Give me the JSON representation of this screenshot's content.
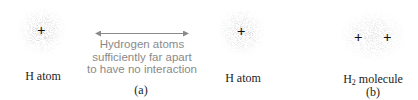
{
  "panel_a": {
    "left_atom_label": "H atom",
    "right_atom_label": "H atom",
    "description_lines": [
      "Hydrogen atoms",
      "sufficiently far apart",
      "to have no interaction"
    ],
    "caption": "(a)"
  },
  "panel_b": {
    "molecule_label_main": "H",
    "molecule_label_sub": "2",
    "molecule_label_rest": " molecule",
    "caption": "(b)"
  },
  "symbols": {
    "nucleus": "+"
  },
  "colors": {
    "cloud": "#9a9a9a",
    "arrow": "#8a8a8a",
    "text_gray": "#8a8a8a",
    "text_dark": "#222222"
  }
}
